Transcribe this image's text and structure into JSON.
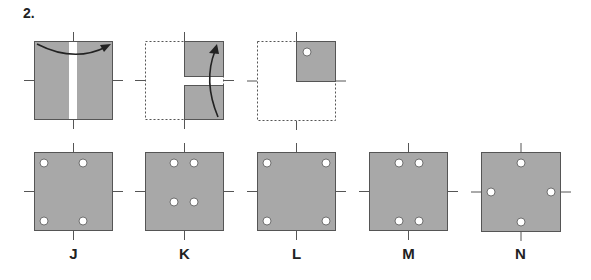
{
  "question": {
    "number": "2."
  },
  "colors": {
    "paper": "#a8a8a8",
    "border": "#555555",
    "hole": "#ffffff",
    "arrow": "#222222"
  },
  "fold_steps": [
    {
      "step": 1,
      "description": "square folded left-to-right over vertical center line"
    },
    {
      "step": 2,
      "description": "right half folded bottom-to-top over horizontal center line"
    },
    {
      "step": 3,
      "description": "hole punched in top-right quadrant"
    }
  ],
  "options": [
    {
      "label": "J",
      "holes": "four holes, two left columns near corners"
    },
    {
      "label": "K",
      "holes": "four holes clustered near center-top"
    },
    {
      "label": "L",
      "holes": "four holes at corners"
    },
    {
      "label": "M",
      "holes": "two holes top center, two bottom center"
    },
    {
      "label": "N",
      "holes": "holes at midpoints of each side"
    }
  ]
}
